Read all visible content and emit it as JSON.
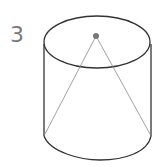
{
  "figure": {
    "label": "3",
    "shape": "cylinder with inscribed cone",
    "colors": {
      "stroke": "#333333",
      "cone_stroke": "#8a8a8a",
      "apex_dot": "#777777",
      "label": "#7a7a7a"
    }
  }
}
